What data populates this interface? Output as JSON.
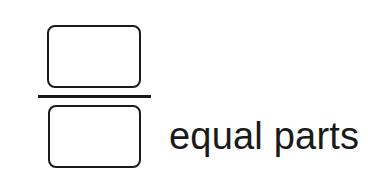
{
  "diagram": {
    "type": "fraction",
    "numerator": {
      "shape": "rounded-rectangle",
      "content": ""
    },
    "fraction_bar": {
      "shape": "horizontal-line"
    },
    "denominator": {
      "shape": "rounded-rectangle",
      "content": ""
    },
    "caption": "equal parts"
  },
  "colors": {
    "stroke": "#1a1a1a",
    "background": "#ffffff",
    "text": "#1a1a1a"
  }
}
